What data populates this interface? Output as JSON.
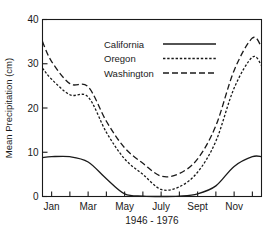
{
  "chart_data": {
    "type": "line",
    "title": "",
    "xlabel": "1946 - 1976",
    "ylabel": "Mean Precipitation (cm)",
    "ylim": [
      0,
      40
    ],
    "yticks": [
      0,
      10,
      20,
      30,
      40
    ],
    "ytick_labels": [
      "0",
      "10",
      "20",
      "30",
      "40"
    ],
    "grid": false,
    "legend_position": "top-center",
    "categories": [
      "Jan",
      "Feb",
      "Mar",
      "Apr",
      "May",
      "June",
      "July",
      "Aug",
      "Sept",
      "Oct",
      "Nov",
      "Dec"
    ],
    "xtick_labels": [
      "Jan",
      "",
      "Mar",
      "",
      "May",
      "",
      "July",
      "",
      "Sept",
      "",
      "Nov",
      ""
    ],
    "x_axis_start_value": 35.0,
    "series": [
      {
        "name": "California",
        "line_style": "solid",
        "values": [
          9.0,
          9.0,
          7.8,
          4.0,
          0.6,
          0.1,
          0.0,
          0.1,
          0.6,
          2.4,
          6.8,
          9.0
        ],
        "start_value": 8.8,
        "end_value": 9.0
      },
      {
        "name": "Oregon",
        "line_style": "dotted",
        "values": [
          26.5,
          23.0,
          22.5,
          14.5,
          8.5,
          5.0,
          1.6,
          2.2,
          5.5,
          12.5,
          24.5,
          31.5
        ],
        "start_value": 29.0,
        "end_value": 29.6
      },
      {
        "name": "Washington",
        "line_style": "dashed",
        "values": [
          30.5,
          25.5,
          24.8,
          17.0,
          11.0,
          7.5,
          4.6,
          5.2,
          8.5,
          16.0,
          28.5,
          35.8
        ],
        "start_value": 35.0,
        "end_value": 33.8
      }
    ],
    "legend": [
      {
        "label": "California",
        "line_style": "solid"
      },
      {
        "label": "Oregon",
        "line_style": "dotted"
      },
      {
        "label": "Washington",
        "line_style": "dashed"
      }
    ]
  }
}
